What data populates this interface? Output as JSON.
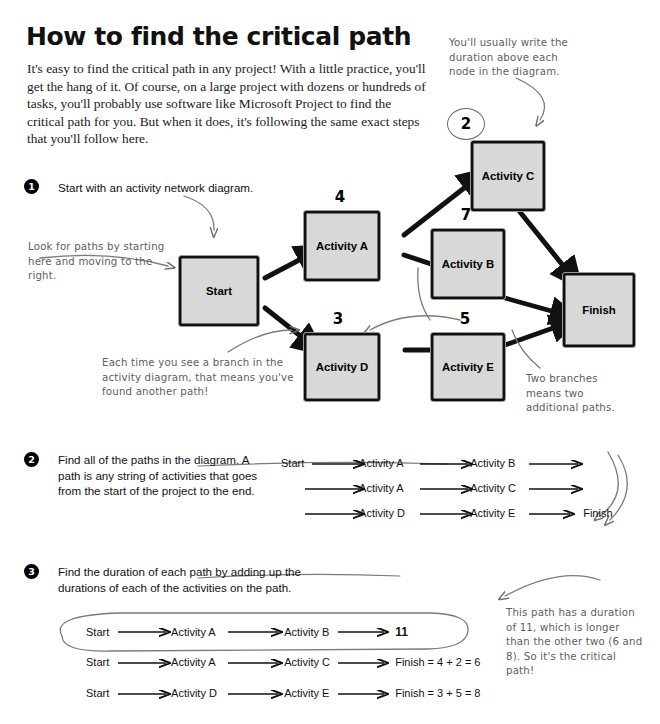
{
  "page": {
    "title": "How to find the critical path",
    "intro": "It's easy to find the critical path in any project! With a little practice, you'll get the hang of it. Of course, on a large project with dozens or hundreds of tasks, you'll probably use software like Microsoft Project to find the critical path for you. But when it does, it's following the same exact steps that you'll follow here."
  },
  "steps": [
    {
      "number": "1",
      "text": "Start with an activity network diagram."
    },
    {
      "number": "2",
      "text": "Find all of the paths in the diagram. A path is any string of activities that goes from the start of the project to the end."
    },
    {
      "number": "3",
      "text": "Find the duration of each path by adding up the durations of each of the activities on the path."
    }
  ],
  "annotations": [
    {
      "id": "duration-note",
      "text": "You'll usually write the duration above each node in the diagram."
    },
    {
      "id": "look-for-paths-note",
      "text": "Look for paths by starting here and moving to the right."
    },
    {
      "id": "branch-note",
      "text": "Each time you see a branch in the activity diagram, that means you've found another path!"
    },
    {
      "id": "two-branches-note",
      "text": "Two branches means two additional paths."
    },
    {
      "id": "critical-path-note",
      "text": "This path has a duration of 11, which is longer than the other two (6 and 8). So it's the critical path!"
    }
  ],
  "diagram": {
    "nodes": [
      {
        "id": "start",
        "label": "Start",
        "duration": ""
      },
      {
        "id": "activity-a",
        "label": "Activity A",
        "duration": "4"
      },
      {
        "id": "activity-b",
        "label": "Activity B",
        "duration": "7"
      },
      {
        "id": "activity-c",
        "label": "Activity C",
        "duration": "2"
      },
      {
        "id": "activity-d",
        "label": "Activity D",
        "duration": "3"
      },
      {
        "id": "activity-e",
        "label": "Activity E",
        "duration": "5"
      },
      {
        "id": "finish",
        "label": "Finish",
        "duration": ""
      }
    ],
    "edges": [
      {
        "from": "start",
        "to": "activity-a"
      },
      {
        "from": "start",
        "to": "activity-d"
      },
      {
        "from": "activity-a",
        "to": "activity-c"
      },
      {
        "from": "activity-a",
        "to": "activity-b"
      },
      {
        "from": "activity-b",
        "to": "finish"
      },
      {
        "from": "activity-c",
        "to": "finish"
      },
      {
        "from": "activity-d",
        "to": "activity-e"
      },
      {
        "from": "activity-e",
        "to": "finish"
      }
    ]
  },
  "paths_list": [
    {
      "n1": "Start",
      "n2": "Activity A",
      "n3": "Activity B",
      "n4": ""
    },
    {
      "n1": "",
      "n2": "Activity A",
      "n3": "Activity C",
      "n4": ""
    },
    {
      "n1": "",
      "n2": "Activity D",
      "n3": "Activity E",
      "n4": "Finish"
    }
  ],
  "durations_list": [
    {
      "n1": "Start",
      "n2": "Activity A",
      "n3": "Activity B",
      "result": "11",
      "highlighted": true
    },
    {
      "n1": "Start",
      "n2": "Activity A",
      "n3": "Activity C",
      "result": "Finish = 4 + 2 = 6",
      "highlighted": false
    },
    {
      "n1": "Start",
      "n2": "Activity D",
      "n3": "Activity E",
      "result": "Finish = 3 + 5 = 8",
      "highlighted": false
    }
  ]
}
